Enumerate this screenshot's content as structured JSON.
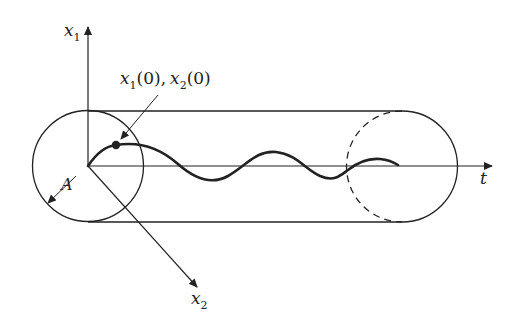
{
  "diagram": {
    "type": "tube-trajectory-3d",
    "axes": {
      "vertical": {
        "name": "x",
        "sub": "1"
      },
      "depth": {
        "name": "x",
        "sub": "2"
      },
      "horizontal": {
        "name": "t"
      }
    },
    "initial_point_label": {
      "a_name": "x",
      "a_sub": "1",
      "a_arg": "(0),",
      "b_name": "x",
      "b_sub": "2",
      "b_arg": "(0)"
    },
    "radius_label": "A",
    "colors": {
      "line": "#222222",
      "background": "#ffffff"
    }
  }
}
